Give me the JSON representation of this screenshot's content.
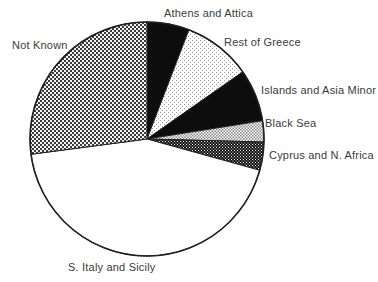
{
  "chart_data": {
    "type": "pie",
    "title": "",
    "legend_position": "labels-around-pie",
    "grid": false,
    "geometry": {
      "cx": 147,
      "cy": 139,
      "r": 117,
      "outline_color": "#1f1f1f"
    },
    "colors": {
      "solid_black": "#0d0d0d",
      "white": "#ffffff",
      "stipple_dot": "#9a9a9a",
      "checker_light_dot": "#878787",
      "checker_dark_bg": "#101010",
      "checker_medium_dark": "#3c3c3c",
      "checker_medium_light": "#f2f2f2"
    },
    "slices": [
      {
        "label": "Athens and Attica",
        "start_angle": 0,
        "end_angle": 21,
        "degrees": 21,
        "percent": 5.8,
        "fill": "solid-black"
      },
      {
        "label": "Rest of Greece",
        "start_angle": 21,
        "end_angle": 55,
        "degrees": 34,
        "percent": 9.4,
        "fill": "stipple-light"
      },
      {
        "label": "Islands and Asia Minor",
        "start_angle": 55,
        "end_angle": 81,
        "degrees": 26,
        "percent": 7.2,
        "fill": "solid-black"
      },
      {
        "label": "Black Sea",
        "start_angle": 81,
        "end_angle": 91.5,
        "degrees": 10.5,
        "percent": 2.9,
        "fill": "checker-light"
      },
      {
        "label": "Cyprus and N. Africa",
        "start_angle": 91.5,
        "end_angle": 105.5,
        "degrees": 14,
        "percent": 3.9,
        "fill": "checker-dark"
      },
      {
        "label": "S. Italy and Sicily",
        "start_angle": 105.5,
        "end_angle": 262.5,
        "degrees": 157,
        "percent": 43.6,
        "fill": "white"
      },
      {
        "label": "Not Known",
        "start_angle": 262.5,
        "end_angle": 360,
        "degrees": 97.5,
        "percent": 27.1,
        "fill": "checker-medium"
      }
    ]
  }
}
